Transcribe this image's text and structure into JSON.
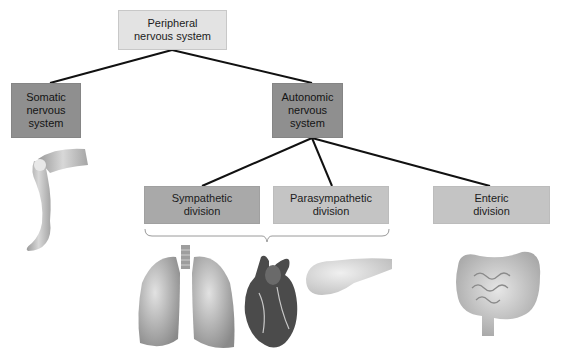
{
  "diagram": {
    "root": {
      "label": "Peripheral\nnervous system"
    },
    "level1": [
      {
        "label": "Somatic\nnervous\nsystem"
      },
      {
        "label": "Autonomic\nnervous\nsystem"
      }
    ],
    "level2": [
      {
        "label": "Sympathetic\ndivision"
      },
      {
        "label": "Parasympathetic\ndivision"
      },
      {
        "label": "Enteric\ndivision"
      }
    ],
    "illustrations": [
      {
        "name": "leg",
        "attached_to": "Somatic nervous system"
      },
      {
        "name": "lungs",
        "attached_to": "Sympathetic / Parasympathetic division"
      },
      {
        "name": "heart",
        "attached_to": "Sympathetic / Parasympathetic division"
      },
      {
        "name": "pancreas",
        "attached_to": "Sympathetic / Parasympathetic division"
      },
      {
        "name": "intestines",
        "attached_to": "Enteric division"
      }
    ],
    "colors": {
      "root_fill": "#e3e3e3",
      "level1_fill": "#8f8f8f",
      "sympathetic_fill": "#a9a9a9",
      "parasympathetic_fill": "#c4c4c4",
      "enteric_fill": "#c4c4c4",
      "connector": "#111111"
    }
  }
}
